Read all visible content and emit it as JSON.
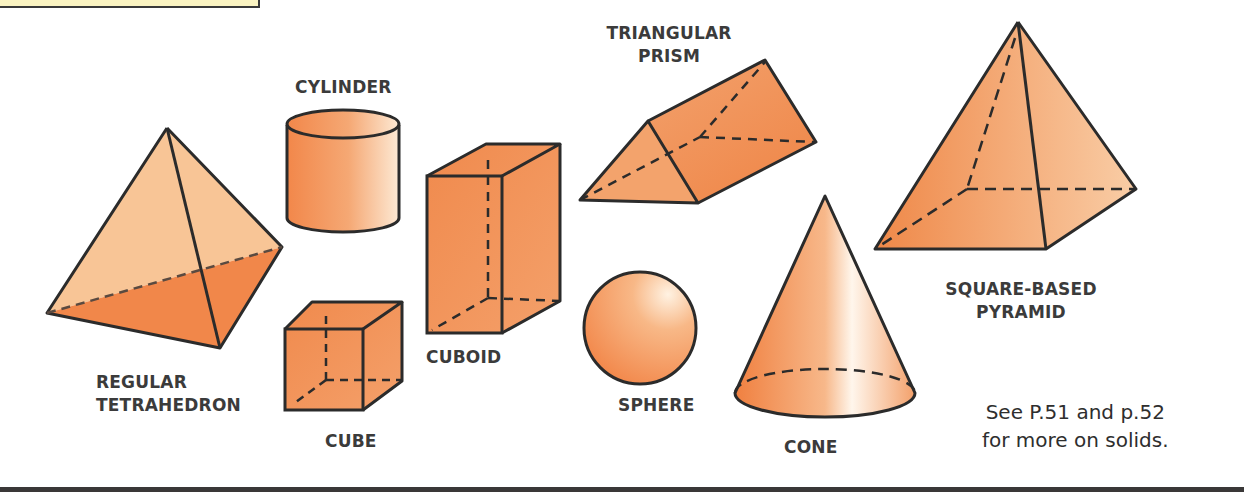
{
  "page": {
    "theme_colors": {
      "solid_fill": "#f2874a",
      "solid_light": "#fbd3ad",
      "tetra_light_face": "#f8c596",
      "edge": "#2b2b2b",
      "label_text": "#3b3b3b",
      "note_box_fill": "#fbf4c2",
      "bottom_bar": "#3a3838"
    }
  },
  "solids": [
    {
      "id": "regular-tetrahedron",
      "label_line1": "REGULAR",
      "label_line2": "TETRAHEDRON"
    },
    {
      "id": "cylinder",
      "label_line1": "CYLINDER"
    },
    {
      "id": "cube",
      "label_line1": "CUBE"
    },
    {
      "id": "cuboid",
      "label_line1": "CUBOID"
    },
    {
      "id": "triangular-prism",
      "label_line1": "TRIANGULAR",
      "label_line2": "PRISM"
    },
    {
      "id": "sphere",
      "label_line1": "SPHERE"
    },
    {
      "id": "cone",
      "label_line1": "CONE"
    },
    {
      "id": "square-based-pyramid",
      "label_line1": "SQUARE-BASED",
      "label_line2": "PYRAMID"
    }
  ],
  "cross_reference": {
    "line1": "See P.51 and p.52",
    "line2": "for more on solids."
  }
}
